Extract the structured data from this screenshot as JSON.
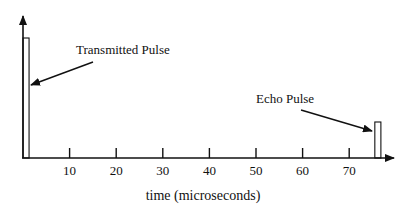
{
  "chart_data": {
    "type": "line",
    "title": "",
    "xlabel": "time (microseconds)",
    "ylabel": "",
    "xlim": [
      0,
      80
    ],
    "x_ticks": [
      10,
      20,
      30,
      40,
      50,
      60,
      70
    ],
    "x_tick_labels": [
      "10",
      "20",
      "30",
      "40",
      "50",
      "60",
      "70"
    ],
    "grid": false,
    "pulses": [
      {
        "name": "Transmitted Pulse",
        "start_us": 0,
        "end_us": 1.3,
        "relative_amplitude": 1.0
      },
      {
        "name": "Echo Pulse",
        "start_us": 75.5,
        "end_us": 76.8,
        "relative_amplitude": 0.3
      }
    ],
    "annotations": [
      {
        "label": "Transmitted Pulse",
        "points_to": "transmitted-pulse"
      },
      {
        "label": "Echo Pulse",
        "points_to": "echo-pulse"
      }
    ]
  },
  "colors": {
    "ink": "#111111",
    "background": "#ffffff"
  }
}
